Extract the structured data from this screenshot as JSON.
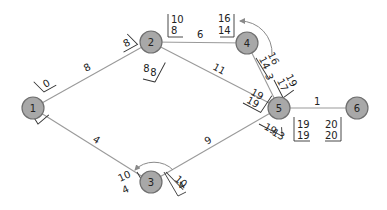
{
  "diagram": {
    "type": "network-activity-diagram",
    "colors": {
      "node_fill": "#a8a8a8",
      "node_stroke": "#6f6f6f",
      "edge": "#9a9a9a",
      "text": "#222222"
    },
    "nodes": [
      {
        "id": "1",
        "label": "1",
        "x": 33,
        "y": 108
      },
      {
        "id": "2",
        "label": "2",
        "x": 151,
        "y": 42
      },
      {
        "id": "3",
        "label": "3",
        "x": 151,
        "y": 182
      },
      {
        "id": "4",
        "label": "4",
        "x": 247,
        "y": 43
      },
      {
        "id": "5",
        "label": "5",
        "x": 279,
        "y": 108
      },
      {
        "id": "6",
        "label": "6",
        "x": 357,
        "y": 108
      }
    ],
    "edges": [
      {
        "from": "1",
        "to": "2",
        "weight": "8"
      },
      {
        "from": "1",
        "to": "3",
        "weight": "4"
      },
      {
        "from": "2",
        "to": "4",
        "weight": "6"
      },
      {
        "from": "2",
        "to": "5",
        "weight": "11"
      },
      {
        "from": "3",
        "to": "5",
        "weight": "9"
      },
      {
        "from": "4",
        "to": "5",
        "weight": "3"
      },
      {
        "from": "5",
        "to": "6",
        "weight": "1"
      }
    ],
    "edge_labels": {
      "e12": "8",
      "e13": "4",
      "e24": "6",
      "e25": "11",
      "e35": "9",
      "e45": "3",
      "e56": "1"
    },
    "time_boxes": {
      "n1_to2": {
        "top": "",
        "bottom": "0"
      },
      "n1_to3": {
        "top": "6",
        "bottom": "0"
      },
      "n2_from1": {
        "top": "",
        "bottom": "8"
      },
      "n2_to4": {
        "top": "10",
        "bottom": "8"
      },
      "n2_to5": {
        "top": "8",
        "bottom": "8"
      },
      "n4_from2": {
        "top": "16",
        "bottom": "14"
      },
      "n4_to5": {
        "top": "16",
        "bottom": "14"
      },
      "n5_from4": {
        "top": "19",
        "bottom": "17"
      },
      "n5_from2": {
        "top": "19",
        "bottom": "19"
      },
      "n5_from3": {
        "top": "19",
        "bottom": "13"
      },
      "n5_to6": {
        "top": "19",
        "bottom": "19"
      },
      "n6_from5": {
        "top": "20",
        "bottom": "20"
      },
      "n3_from1": {
        "top": "10",
        "bottom": "4"
      },
      "n3_to5": {
        "top": "10",
        "bottom": "4"
      }
    }
  }
}
